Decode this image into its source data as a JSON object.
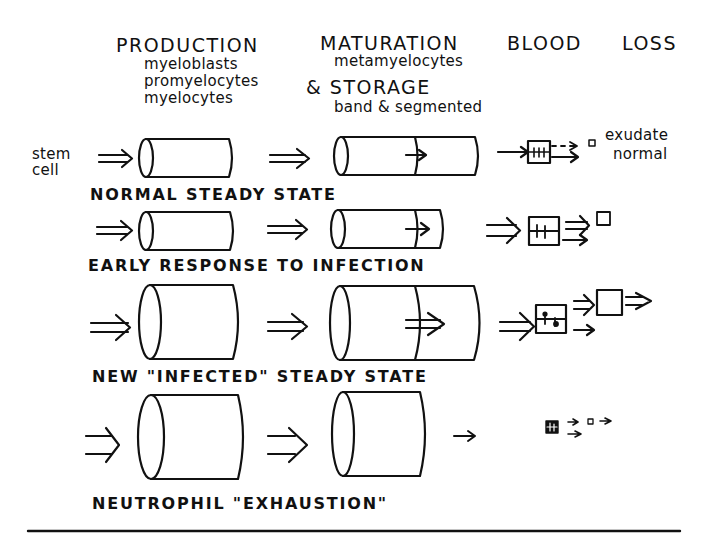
{
  "headers": {
    "production": "PRODUCTION",
    "production_cells": [
      "myeloblasts",
      "promyelocytes",
      "myelocytes"
    ],
    "maturation": "MATURATION",
    "maturation_cells": "metamyelocytes",
    "storage": "& STORAGE",
    "storage_cells": "band & segmented",
    "blood": "BLOOD",
    "loss": "LOSS"
  },
  "stem_cell_label": [
    "stem",
    "cell"
  ],
  "rows": [
    {
      "label": "NORMAL STEADY STATE",
      "outputs": [
        "exudate",
        "normal"
      ],
      "output_marker": "o"
    },
    {
      "label": "EARLY RESPONSE TO INFECTION"
    },
    {
      "label": "NEW \"INFECTED\" STEADY STATE"
    },
    {
      "label": "NEUTROPHIL \"EXHAUSTION\""
    }
  ]
}
